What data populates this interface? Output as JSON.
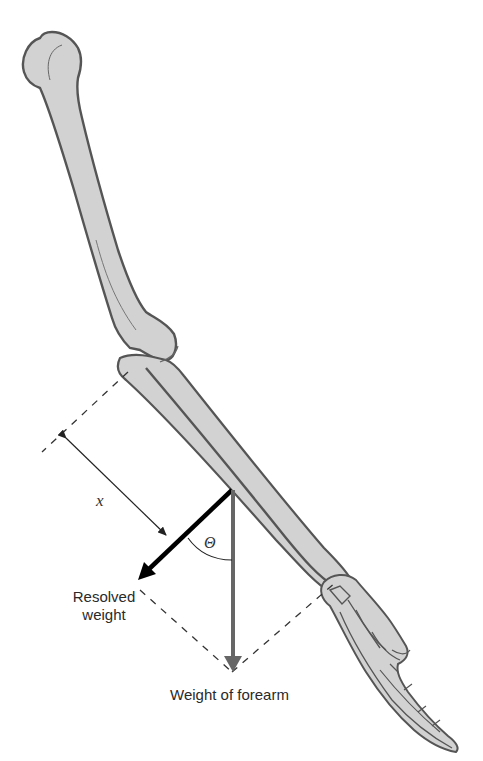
{
  "diagram": {
    "labels": {
      "distance": "x",
      "angle": "Θ",
      "resolved_weight_line1": "Resolved",
      "resolved_weight_line2": "weight",
      "weight_of_forearm": "Weight of forearm"
    },
    "colors": {
      "bone_fill": "#d2d2d2",
      "bone_outline": "#555555",
      "weight_arrow": "#666666",
      "resolved_arrow": "#000000",
      "dashed_lines": "#333333",
      "text": "#2a2a2a"
    }
  }
}
